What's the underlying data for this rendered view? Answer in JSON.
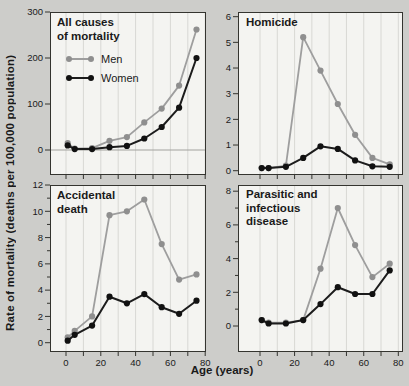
{
  "figure": {
    "y_axis_label": "Rate of mortality (deaths per 100,000 population)",
    "x_axis_label": "Age (years)",
    "legend": {
      "men": "Men",
      "women": "Women"
    },
    "colors": {
      "background": "#cdcdca",
      "panel_bg": "#f4f4f1",
      "grid": "#d8d8d4",
      "frame": "#34342f",
      "men_line": "#9e9e9e",
      "men_marker": "#8f8f8f",
      "women_line": "#1c1c1c",
      "women_marker": "#111111",
      "text": "#1a1a1a",
      "zero_line": "#a2a29e"
    }
  },
  "chart_data": [
    {
      "type": "line",
      "title": "All causes\nof mortality",
      "xlabel": "Age (years)",
      "ylabel": "Rate of mortality (deaths per 100,000 population)",
      "x": [
        1,
        5,
        15,
        25,
        35,
        45,
        55,
        65,
        75
      ],
      "series": [
        {
          "name": "Men",
          "values": [
            15,
            3,
            4,
            20,
            28,
            60,
            90,
            140,
            262
          ]
        },
        {
          "name": "Women",
          "values": [
            10,
            2,
            2,
            6,
            9,
            25,
            50,
            92,
            200
          ]
        }
      ],
      "ylim": [
        0,
        300
      ],
      "yticks": [
        0,
        100,
        200,
        300
      ],
      "yticks_minor": [],
      "xlim": [
        0,
        80
      ],
      "xticks": [
        0,
        10,
        20,
        30,
        40,
        50,
        60,
        70,
        80
      ],
      "xtick_labels": [],
      "grid": "vertical",
      "zero_line": true,
      "legend_position": "upper-left"
    },
    {
      "type": "line",
      "title": "Homicide",
      "xlabel": "Age (years)",
      "ylabel": "Rate of mortality (deaths per 100,000 population)",
      "x": [
        1,
        5,
        15,
        25,
        35,
        45,
        55,
        65,
        75
      ],
      "series": [
        {
          "name": "Men",
          "values": [
            0.1,
            0.1,
            0.2,
            5.2,
            3.9,
            2.6,
            1.4,
            0.5,
            0.25
          ]
        },
        {
          "name": "Women",
          "values": [
            0.1,
            0.1,
            0.15,
            0.5,
            0.95,
            0.85,
            0.4,
            0.17,
            0.15
          ]
        }
      ],
      "ylim": [
        0,
        6
      ],
      "yticks": [
        0,
        1,
        2,
        3,
        4,
        5,
        6
      ],
      "yticks_minor": [],
      "xlim": [
        0,
        80
      ],
      "xticks": [
        0,
        10,
        20,
        30,
        40,
        50,
        60,
        70,
        80
      ],
      "xtick_labels": [],
      "grid": "vertical",
      "zero_line": false
    },
    {
      "type": "line",
      "title": "Accidental\ndeath",
      "xlabel": "Age (years)",
      "ylabel": "Rate of mortality (deaths per 100,000 population)",
      "x": [
        1,
        5,
        15,
        25,
        35,
        45,
        55,
        65,
        75
      ],
      "series": [
        {
          "name": "Men",
          "values": [
            0.4,
            0.9,
            2.0,
            9.7,
            10.0,
            10.9,
            7.5,
            4.8,
            5.2
          ]
        },
        {
          "name": "Women",
          "values": [
            0.15,
            0.6,
            1.3,
            3.5,
            3.0,
            3.7,
            2.7,
            2.2,
            3.2
          ]
        }
      ],
      "ylim": [
        0,
        12
      ],
      "yticks": [
        0,
        2,
        4,
        6,
        8,
        10,
        12
      ],
      "yticks_minor": [
        1,
        3,
        5,
        7,
        9,
        11
      ],
      "xlim": [
        0,
        80
      ],
      "xticks": [
        0,
        10,
        20,
        30,
        40,
        50,
        60,
        70,
        80
      ],
      "xtick_labels": [
        0,
        20,
        40,
        60,
        80
      ],
      "grid": "vertical",
      "zero_line": false
    },
    {
      "type": "line",
      "title": "Parasitic and\ninfectious\ndisease",
      "xlabel": "Age (years)",
      "ylabel": "Rate of mortality (deaths per 100,000 population)",
      "x": [
        1,
        5,
        15,
        25,
        35,
        45,
        55,
        65,
        75
      ],
      "series": [
        {
          "name": "Men",
          "values": [
            0.35,
            0.2,
            0.2,
            0.35,
            3.4,
            7.0,
            4.8,
            2.9,
            3.7
          ]
        },
        {
          "name": "Women",
          "values": [
            0.35,
            0.15,
            0.15,
            0.35,
            1.3,
            2.3,
            1.9,
            1.9,
            3.3
          ]
        }
      ],
      "ylim": [
        0,
        8
      ],
      "yticks": [
        0,
        2,
        4,
        6,
        8
      ],
      "yticks_minor": [
        1,
        3,
        5,
        7
      ],
      "xlim": [
        0,
        80
      ],
      "xticks": [
        0,
        10,
        20,
        30,
        40,
        50,
        60,
        70,
        80
      ],
      "xtick_labels": [
        0,
        20,
        40,
        60,
        80
      ],
      "grid": "vertical",
      "zero_line": false
    }
  ]
}
